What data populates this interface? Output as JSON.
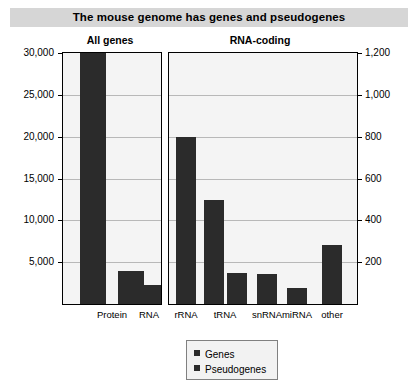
{
  "title": "The mouse genome has genes and pseudogenes",
  "panels": {
    "left": {
      "header": "All genes",
      "y_ticks": [
        "30,000",
        "25,000",
        "20,000",
        "15,000",
        "10,000",
        "5,000"
      ],
      "categories": [
        "Protein",
        "RNA"
      ]
    },
    "right": {
      "header": "RNA-coding",
      "y_ticks": [
        "1,200",
        "1,000",
        "800",
        "600",
        "400",
        "200"
      ],
      "categories": [
        "rRNA",
        "tRNA",
        "snRNA",
        "miRNA",
        "other"
      ]
    }
  },
  "legend": {
    "items": [
      {
        "label": "Genes",
        "color": "#2b2b2b"
      },
      {
        "label": "Pseudogenes",
        "color": "#2b2b2b"
      }
    ]
  },
  "colors": {
    "bar": "#2b2b2b",
    "plot_background": "#f4f4f4",
    "gridline": "#b8b8b8",
    "title_band": "#d6d6d6",
    "axis": "#000000"
  },
  "chart_data": [
    {
      "type": "bar",
      "title": "All genes",
      "xlabel": "",
      "ylabel": "",
      "ylim": [
        0,
        30000
      ],
      "ytick_values": [
        5000,
        10000,
        15000,
        20000,
        25000,
        30000
      ],
      "grid": true,
      "legend_position": "bottom-center",
      "categories": [
        "Protein",
        "RNA"
      ],
      "series": [
        {
          "name": "Genes",
          "values": [
            30000,
            2300
          ]
        },
        {
          "name": "Pseudogenes",
          "values": [
            4000,
            0
          ]
        }
      ]
    },
    {
      "type": "bar",
      "title": "RNA-coding",
      "xlabel": "",
      "ylabel": "",
      "ylim": [
        0,
        1200
      ],
      "ytick_values": [
        200,
        400,
        600,
        800,
        1000,
        1200
      ],
      "grid": true,
      "legend_position": "bottom-center",
      "axis_side": "right",
      "categories": [
        "rRNA",
        "tRNA",
        "snRNA",
        "miRNA",
        "other"
      ],
      "series": [
        {
          "name": "Genes",
          "values": [
            800,
            495,
            145,
            75,
            280
          ]
        },
        {
          "name": "Pseudogenes",
          "values": [
            0,
            150,
            0,
            0,
            0
          ]
        }
      ]
    }
  ]
}
